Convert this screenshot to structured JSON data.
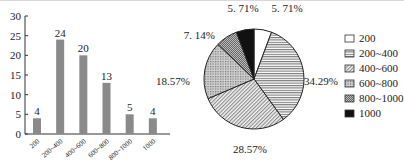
{
  "chart_data": [
    {
      "type": "bar",
      "title": "",
      "xlabel": "",
      "ylabel": "",
      "categories": [
        "200",
        "200~400",
        "400~600",
        "600~800",
        "800~1000",
        "1000"
      ],
      "values": [
        4,
        24,
        20,
        13,
        5,
        4
      ],
      "data_labels": [
        "4",
        "24",
        "20",
        "13",
        "5",
        "4"
      ],
      "ylim": [
        0,
        30
      ],
      "yticks": [
        0,
        5,
        10,
        15,
        20,
        25,
        30
      ],
      "bar_color": "#8a8a8a",
      "grid": false
    },
    {
      "type": "pie",
      "title": "",
      "categories": [
        "200",
        "200~400",
        "400~600",
        "600~800",
        "800~1000",
        "1000"
      ],
      "values": [
        5.71,
        34.29,
        28.57,
        18.57,
        7.14,
        5.71
      ],
      "data_labels": [
        "5. 71%",
        "34.29%",
        "28.57%",
        "18.57%",
        "7. 14%",
        "5. 71%"
      ],
      "start": "top",
      "direction": "clockwise",
      "legend": {
        "position": "right",
        "entries": [
          "200",
          "200~400",
          "400~600",
          "600~800",
          "800~1000",
          "1000"
        ],
        "fills": [
          "white",
          "hstripe",
          "diagonal",
          "crosshatch",
          "dense-hstripe",
          "black"
        ]
      }
    }
  ]
}
